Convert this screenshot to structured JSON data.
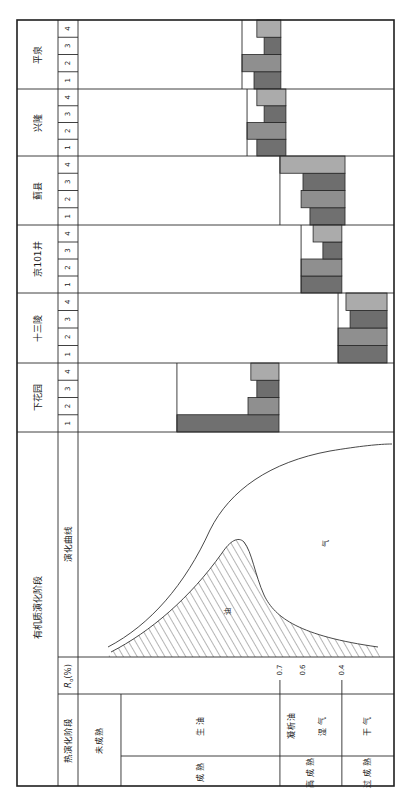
{
  "figure": {
    "stage_header": "有机质演化阶段",
    "curve_header": "演化曲线",
    "ro_header": {
      "symbol": "R",
      "subscript": "o",
      "unit": "(%)"
    },
    "thermal_stage_header": "热演化阶段",
    "bar_colors": [
      "#707070",
      "#8f8f8f",
      "#6e6e6e",
      "#ababab"
    ],
    "line_color": "#2b2b2b"
  },
  "wells": [
    {
      "name": "平泉",
      "columns": [
        "1",
        "2",
        "3",
        "4"
      ],
      "ranges": [
        [
          0.557,
          0.642
        ],
        [
          0.519,
          0.642
        ],
        [
          0.589,
          0.642
        ],
        [
          0.566,
          0.642
        ]
      ]
    },
    {
      "name": "兴隆",
      "columns": [
        "1",
        "2",
        "3",
        "4"
      ],
      "ranges": [
        [
          0.566,
          0.658
        ],
        [
          0.535,
          0.658
        ],
        [
          0.589,
          0.658
        ],
        [
          0.566,
          0.658
        ]
      ]
    },
    {
      "name": "蓟县",
      "columns": [
        "1",
        "2",
        "3",
        "4"
      ],
      "ranges": [
        [
          0.734,
          0.845
        ],
        [
          0.706,
          0.845
        ],
        [
          0.712,
          0.845
        ],
        [
          0.639,
          0.845
        ]
      ]
    },
    {
      "name": "京101井",
      "columns": [
        "1",
        "2",
        "3",
        "4"
      ],
      "ranges": [
        [
          0.706,
          0.835
        ],
        [
          0.706,
          0.835
        ],
        [
          0.775,
          0.835
        ],
        [
          0.744,
          0.835
        ]
      ]
    },
    {
      "name": "十三陵",
      "columns": [
        "1",
        "2",
        "3",
        "4"
      ],
      "ranges": [
        [
          0.823,
          0.978
        ],
        [
          0.823,
          0.978
        ],
        [
          0.861,
          0.978
        ],
        [
          0.848,
          0.978
        ]
      ]
    },
    {
      "name": "下花园",
      "columns": [
        "1",
        "2",
        "3",
        "4"
      ],
      "ranges": [
        [
          0.313,
          0.636
        ],
        [
          0.538,
          0.636
        ],
        [
          0.566,
          0.636
        ],
        [
          0.547,
          0.636
        ]
      ]
    }
  ],
  "ro_ticks": [
    {
      "label": "0.7",
      "pos": 0.639,
      "tick": true
    },
    {
      "label": "0.6",
      "pos": 0.712,
      "tick": false
    },
    {
      "label": "0.4",
      "pos": 0.835,
      "tick": true
    }
  ],
  "stages": {
    "main": [
      {
        "label": "未成熟",
        "range": [
          0.0,
          0.136
        ]
      },
      {
        "label": "成熟",
        "range": [
          0.136,
          0.639
        ]
      },
      {
        "label": "高成熟",
        "range": [
          0.639,
          0.835
        ]
      },
      {
        "label": "过成熟",
        "range": [
          0.835,
          1.0
        ]
      }
    ],
    "detail": [
      {
        "label": "生油",
        "range": [
          0.136,
          0.639
        ]
      },
      {
        "label": "凝析油",
        "range": [
          0.639,
          0.712
        ]
      },
      {
        "label": "湿气",
        "range": [
          0.712,
          0.835
        ]
      },
      {
        "label": "干气",
        "range": [
          0.835,
          1.0
        ]
      }
    ]
  },
  "curve": {
    "oil_label": "油",
    "gas_label": "气"
  }
}
